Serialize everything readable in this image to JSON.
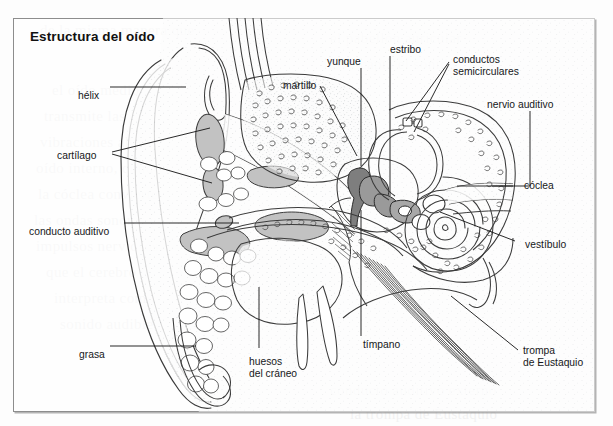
{
  "figure": {
    "title": "Estructura del oído",
    "kind": "anatomical-cross-section-diagram",
    "language": "es",
    "frame": {
      "border_color": "#8d8d8d",
      "background": "#fdfdfd"
    }
  },
  "ghost_text": [
    {
      "text": "de la misma manera que",
      "x": 40,
      "y": 22
    },
    {
      "text": "el oído medio",
      "x": 52,
      "y": 82
    },
    {
      "text": "transmite las",
      "x": 44,
      "y": 108
    },
    {
      "text": "vibraciones al",
      "x": 40,
      "y": 134
    },
    {
      "text": "oído interno, donde",
      "x": 36,
      "y": 160
    },
    {
      "text": "la cóclea convierte",
      "x": 38,
      "y": 186
    },
    {
      "text": "las ondas sonoras en",
      "x": 34,
      "y": 212
    },
    {
      "text": "impulsos nerviosos",
      "x": 36,
      "y": 238
    },
    {
      "text": "que el cerebro",
      "x": 46,
      "y": 264
    },
    {
      "text": "interpreta como",
      "x": 54,
      "y": 290
    },
    {
      "text": "sonido audible",
      "x": 60,
      "y": 316
    },
    {
      "text": "el pabellón auricular",
      "x": 330,
      "y": 30
    },
    {
      "text": "capta el sonido",
      "x": 360,
      "y": 56
    },
    {
      "text": "y lo dirige",
      "x": 398,
      "y": 212
    },
    {
      "text": "hacia el",
      "x": 420,
      "y": 238
    },
    {
      "text": "conducto auditivo externo",
      "x": 330,
      "y": 382
    },
    {
      "text": "la trompa de Eustaquio",
      "x": 350,
      "y": 406
    }
  ],
  "labels": [
    {
      "id": "helix",
      "text": "hélix",
      "x": 78,
      "y": 90,
      "align": "left"
    },
    {
      "id": "cartilago",
      "text": "cartílago",
      "x": 57,
      "y": 150,
      "align": "left"
    },
    {
      "id": "conducto-auditivo",
      "text": "conducto auditivo",
      "x": 29,
      "y": 226,
      "align": "left"
    },
    {
      "id": "grasa",
      "text": "grasa",
      "x": 79,
      "y": 349,
      "align": "left"
    },
    {
      "id": "huesos-del-craneo",
      "text": "huesos\ndel cráneo",
      "x": 249,
      "y": 356,
      "align": "left"
    },
    {
      "id": "martillo",
      "text": "martillo",
      "x": 283,
      "y": 80,
      "align": "left"
    },
    {
      "id": "yunque",
      "text": "yunque",
      "x": 327,
      "y": 56,
      "align": "left"
    },
    {
      "id": "estribo",
      "text": "estribo",
      "x": 390,
      "y": 44,
      "align": "left"
    },
    {
      "id": "timpano",
      "text": "tímpano",
      "x": 363,
      "y": 339,
      "align": "left"
    },
    {
      "id": "conductos-semicirculares",
      "text": "conductos\nsemicirculares",
      "x": 453,
      "y": 54,
      "align": "left"
    },
    {
      "id": "nervio-auditivo",
      "text": "nervio auditivo",
      "x": 487,
      "y": 99,
      "align": "left"
    },
    {
      "id": "coclea",
      "text": "cóclea",
      "x": 524,
      "y": 180,
      "align": "left"
    },
    {
      "id": "vestibulo",
      "text": "vestíbulo",
      "x": 525,
      "y": 239,
      "align": "left"
    },
    {
      "id": "trompa-de-eustaquio",
      "text": "trompa\nde Eustaquio",
      "x": 523,
      "y": 345,
      "align": "left"
    }
  ]
}
